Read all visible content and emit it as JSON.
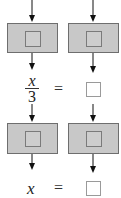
{
  "diagram": {
    "type": "function-machine",
    "colors": {
      "machine_fill": "#c8c8c8",
      "machine_border": "#6e6e6e",
      "answer_box_border": "#9a9a9a",
      "arrow": "#111111"
    },
    "rows": [
      {
        "machines": 2,
        "left_output": {
          "numerator": "x",
          "denominator": "3"
        },
        "equals": "=",
        "right_output": ""
      },
      {
        "machines": 2,
        "left_output": {
          "variable": "x"
        },
        "equals": "=",
        "right_output": ""
      }
    ]
  }
}
